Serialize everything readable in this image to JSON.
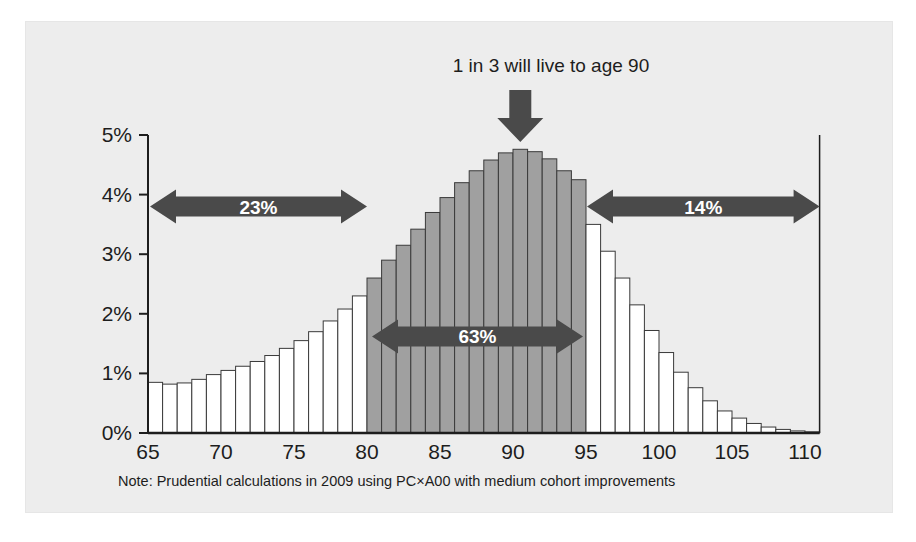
{
  "figure": {
    "title": "1 in 3 will live to age 90",
    "note": "Note: Prudential calculations in 2009 using PC×A00 with medium cohort improvements",
    "colors": {
      "panel_background": "#ededed",
      "bar_highlight_fill": "#a0a0a0",
      "bar_plain_fill": "#ffffff",
      "bar_outline": "#3a3a3a",
      "annotation_arrow": "#4a4a4a",
      "annotation_text": "#ffffff",
      "axis": "#1d1d1d"
    }
  },
  "annotations": {
    "pointer": {
      "label": "1 in 3 will live to age 90",
      "icon": "down-arrow",
      "target_age": 90
    },
    "left_band": {
      "label": "23%",
      "from_age": 65,
      "to_age": 80,
      "style": "double-headed-arrow"
    },
    "middle_band": {
      "label": "63%",
      "from_age": 80,
      "to_age": 95,
      "style": "double-headed-arrow"
    },
    "right_band": {
      "label": "14%",
      "from_age": 95,
      "to_age": 111,
      "style": "double-headed-arrow"
    }
  },
  "chart_data": {
    "type": "bar",
    "title": "1 in 3 will live to age 90",
    "xlabel": "",
    "ylabel": "",
    "xlim": [
      65,
      111
    ],
    "ylim": [
      0,
      5
    ],
    "grid": false,
    "legend": false,
    "ytick_labels": [
      "0%",
      "1%",
      "2%",
      "3%",
      "4%",
      "5%"
    ],
    "ytick_values": [
      0,
      1,
      2,
      3,
      4,
      5
    ],
    "xtick_labels": [
      "65",
      "70",
      "75",
      "80",
      "85",
      "90",
      "95",
      "100",
      "105",
      "110"
    ],
    "xtick_values": [
      65,
      70,
      75,
      80,
      85,
      90,
      95,
      100,
      105,
      110
    ],
    "highlight_range": [
      80,
      95
    ],
    "categories": [
      65,
      66,
      67,
      68,
      69,
      70,
      71,
      72,
      73,
      74,
      75,
      76,
      77,
      78,
      79,
      80,
      81,
      82,
      83,
      84,
      85,
      86,
      87,
      88,
      89,
      90,
      91,
      92,
      93,
      94,
      95,
      96,
      97,
      98,
      99,
      100,
      101,
      102,
      103,
      104,
      105,
      106,
      107,
      108,
      109,
      110
    ],
    "values": [
      0.85,
      0.82,
      0.84,
      0.9,
      0.98,
      1.05,
      1.12,
      1.2,
      1.3,
      1.42,
      1.55,
      1.7,
      1.88,
      2.08,
      2.3,
      2.6,
      2.9,
      3.15,
      3.42,
      3.7,
      3.95,
      4.2,
      4.4,
      4.58,
      4.7,
      4.76,
      4.72,
      4.6,
      4.4,
      4.25,
      3.5,
      3.05,
      2.6,
      2.15,
      1.72,
      1.35,
      1.02,
      0.76,
      0.54,
      0.37,
      0.25,
      0.16,
      0.1,
      0.06,
      0.035,
      0.02
    ]
  }
}
